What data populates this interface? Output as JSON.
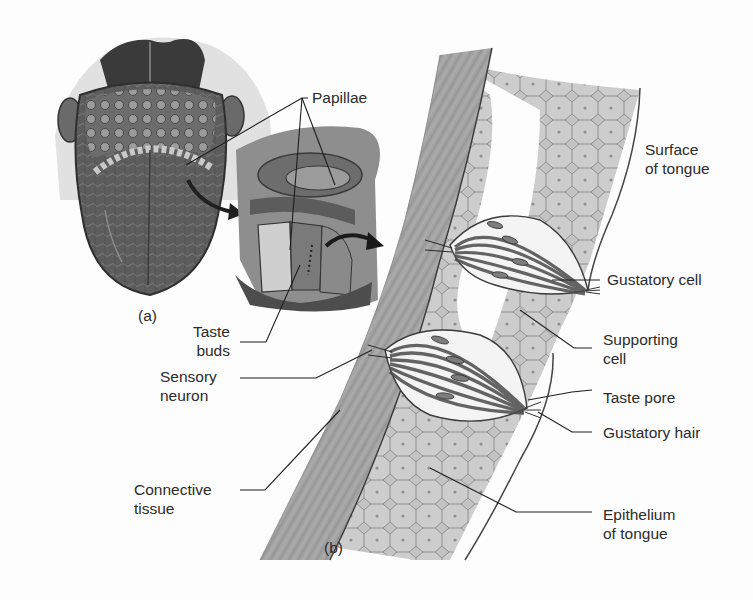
{
  "figure": {
    "panels": [
      {
        "id": "a",
        "label": "(a)",
        "description": "Tongue surface with enlarged papilla cross-section"
      },
      {
        "id": "b",
        "label": "(b)",
        "description": "Section of tongue epithelium showing taste buds"
      }
    ],
    "labels": {
      "papillae": {
        "line1": "Papillae"
      },
      "surface_of_tongue": {
        "line1": "Surface",
        "line2": "of tongue"
      },
      "gustatory_cell": {
        "line1": "Gustatory cell"
      },
      "supporting_cell": {
        "line1": "Supporting",
        "line2": "cell"
      },
      "taste_pore": {
        "line1": "Taste pore"
      },
      "gustatory_hair": {
        "line1": "Gustatory hair"
      },
      "epithelium_of_tongue": {
        "line1": "Epithelium",
        "line2": "of tongue"
      },
      "taste_buds": {
        "line1": "Taste",
        "line2": "buds"
      },
      "sensory_neuron": {
        "line1": "Sensory",
        "line2": "neuron"
      },
      "connective_tissue": {
        "line1": "Connective",
        "line2": "tissue"
      }
    },
    "colors": {
      "background": "#fdfdfd",
      "ink": "#2b2b2b",
      "tissue_dark": "#5a5a5a",
      "tissue_mid": "#9a9a9a",
      "tissue_light": "#c8c8c8",
      "cell_fill": "#bdbdbd"
    }
  }
}
